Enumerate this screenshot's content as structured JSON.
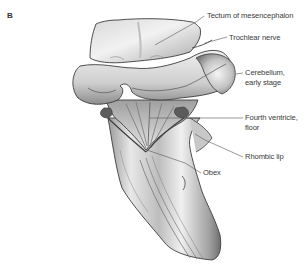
{
  "figure": {
    "panel_letter": "B",
    "structure": "embryonic-brainstem-dorsal-view",
    "colors": {
      "outline": "#3c3c3c",
      "shade_dark": "#7a7a7a",
      "shade_mid": "#b8b8b8",
      "shade_light": "#e6e6e6",
      "leader_line": "#555555",
      "label_text": "#3a3a3a"
    }
  },
  "labels": {
    "tectum": "Tectum of mesencephalon",
    "trochlear": "Trochlear nerve",
    "cerebellum_line1": "Cerebellum,",
    "cerebellum_line2": "early stage",
    "fourth_line1": "Fourth ventricle,",
    "fourth_line2": "floor",
    "rhombic": "Rhombic lip",
    "obex": "Obex"
  }
}
